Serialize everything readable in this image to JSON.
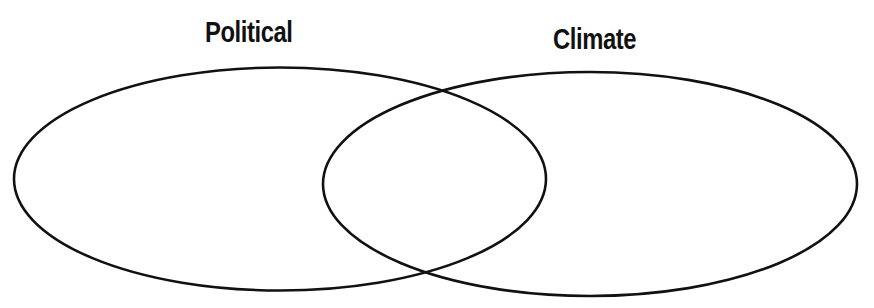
{
  "diagram": {
    "type": "venn",
    "sets": [
      {
        "id": "political",
        "label": "Political"
      },
      {
        "id": "climate",
        "label": "Climate"
      }
    ],
    "regions": {
      "political_only": "",
      "overlap": "",
      "climate_only": ""
    },
    "colors": {
      "stroke": "#111111",
      "background": "#ffffff"
    }
  }
}
